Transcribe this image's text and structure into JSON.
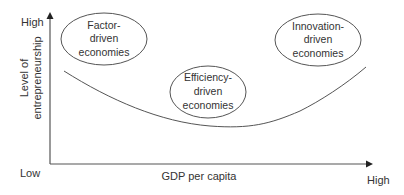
{
  "diagram": {
    "type": "conceptual-curve",
    "y_axis": {
      "label_line1": "Level of",
      "label_line2": "entrepreneurship",
      "high": "High",
      "low": "Low"
    },
    "x_axis": {
      "label": "GDP per capita",
      "high": "High"
    },
    "stages": [
      {
        "line1": "Factor-",
        "line2": "driven",
        "line3": "economies"
      },
      {
        "line1": "Efficiency-",
        "line2": "driven",
        "line3": "economies"
      },
      {
        "line1": "Innovation-",
        "line2": "driven",
        "line3": "economies"
      }
    ],
    "colors": {
      "line": "#555555",
      "text": "#333333",
      "background": "#ffffff"
    }
  }
}
